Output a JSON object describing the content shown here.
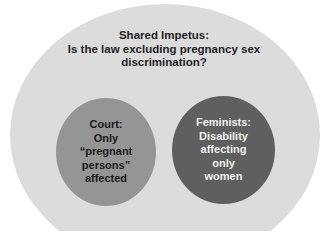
{
  "diagram": {
    "outer": {
      "title_lines": [
        "Shared Impetus:",
        "Is the law excluding pregnancy sex",
        "discrimination?"
      ],
      "color": "#dcdcdc"
    },
    "circles": [
      {
        "id": "court",
        "lines": [
          "Court:",
          "Only",
          "“pregnant",
          "persons”",
          "affected"
        ],
        "color": "#959595"
      },
      {
        "id": "feminists",
        "lines": [
          "Feminists:",
          "Disability",
          "affecting",
          "only",
          "women"
        ],
        "color": "#5f5f5f"
      }
    ]
  }
}
